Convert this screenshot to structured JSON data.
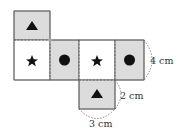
{
  "diagram": {
    "type": "box-net",
    "faces": [
      {
        "id": "top",
        "symbol": "triangle",
        "shaded": true
      },
      {
        "id": "row-1",
        "symbol": "star",
        "shaded": false
      },
      {
        "id": "row-2",
        "symbol": "circle",
        "shaded": true
      },
      {
        "id": "row-3",
        "symbol": "star",
        "shaded": false
      },
      {
        "id": "row-4",
        "symbol": "circle",
        "shaded": true
      },
      {
        "id": "bottom",
        "symbol": "triangle",
        "shaded": true
      }
    ],
    "labels": {
      "height": "4 cm",
      "depth": "2 cm",
      "width": "3 cm"
    },
    "colors": {
      "shaded": "#dcdcdc",
      "outline": "#666666",
      "symbol": "#111111"
    }
  }
}
